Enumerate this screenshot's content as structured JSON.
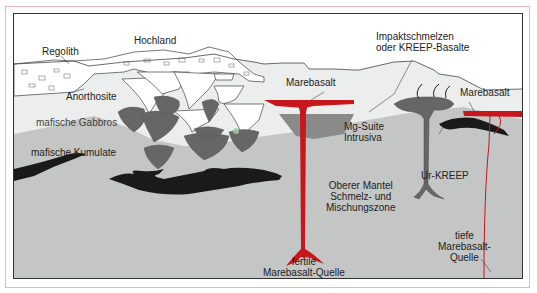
{
  "diagram": {
    "labels": {
      "regolith": "Regolith",
      "hochland": "Hochland",
      "impakt_line1": "Impaktschmelzen",
      "impakt_line2": "oder KREEP-Basalte",
      "marebasalt_left": "Marebasalt",
      "marebasalt_right": "Marebasalt",
      "anorthosite": "Anorthosite",
      "mafische_gabbros": "mafische Gabbros",
      "mafische_kumulate": "mafische Kumulate",
      "mg_suite_line1": "Mg-Suite",
      "mg_suite_line2": "Intrusiva",
      "ur_kreep": "Ur-KREEP",
      "mantel_line1": "Oberer Mantel",
      "mantel_line2": "Schmelz- und",
      "mantel_line3": "Mischungszone",
      "fertile_line1": "fertile",
      "fertile_line2": "Marebasalt-Quelle",
      "tiefe_line1": "tiefe",
      "tiefe_line2": "Marebasalt-",
      "tiefe_line3": "Quelle"
    },
    "colors": {
      "marebasalt_red": "#c8161d",
      "mantle_gray": "#c4c6c6",
      "crust_light": "#eceeee",
      "mafic_dark": "#666666",
      "cumulate_black": "#1a1a1a",
      "frame_pink": "#e8b4b8"
    }
  }
}
